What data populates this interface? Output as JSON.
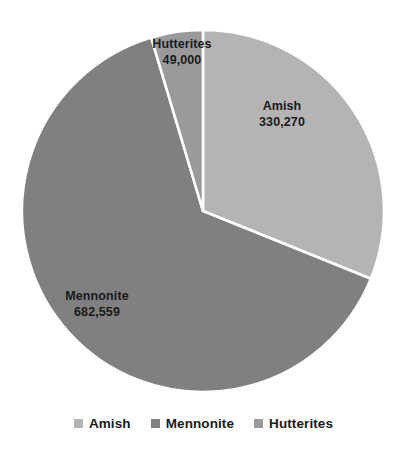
{
  "chart_data": {
    "type": "pie",
    "title": "",
    "labels": [
      "Amish",
      "Mennonite",
      "Hutterites"
    ],
    "values": [
      330270,
      682559,
      49000
    ],
    "value_labels": [
      "330,270",
      "682,559",
      "49,000"
    ],
    "total": 1061829,
    "percentages": [
      31.11,
      64.28,
      4.61
    ],
    "start_angle_deg": 0,
    "direction": "clockwise",
    "colors": [
      "#b4b4b4",
      "#808080",
      "#9a9a9a"
    ],
    "slice_border_color": "#ffffff",
    "legend_position": "bottom",
    "grid": false,
    "slices": [
      {
        "name": "Amish",
        "value": 330270,
        "value_label": "330,270",
        "percent": 31.11,
        "color": "#b4b4b4",
        "start_deg": 0,
        "end_deg": 111.99
      },
      {
        "name": "Mennonite",
        "value": 682559,
        "value_label": "682,559",
        "percent": 64.28,
        "color": "#808080",
        "start_deg": 111.99,
        "end_deg": 343.39
      },
      {
        "name": "Hutterites",
        "value": 49000,
        "value_label": "49,000",
        "percent": 4.61,
        "color": "#9a9a9a",
        "start_deg": 343.39,
        "end_deg": 360
      }
    ]
  },
  "labels": {
    "amish": {
      "name": "Amish",
      "value": "330,270"
    },
    "mennonite": {
      "name": "Mennonite",
      "value": "682,559"
    },
    "hutterites": {
      "name": "Hutterites",
      "value": "49,000"
    }
  },
  "legend": {
    "items": [
      {
        "label": "Amish",
        "color": "#b4b4b4"
      },
      {
        "label": "Mennonite",
        "color": "#808080"
      },
      {
        "label": "Hutterites",
        "color": "#9a9a9a"
      }
    ]
  }
}
